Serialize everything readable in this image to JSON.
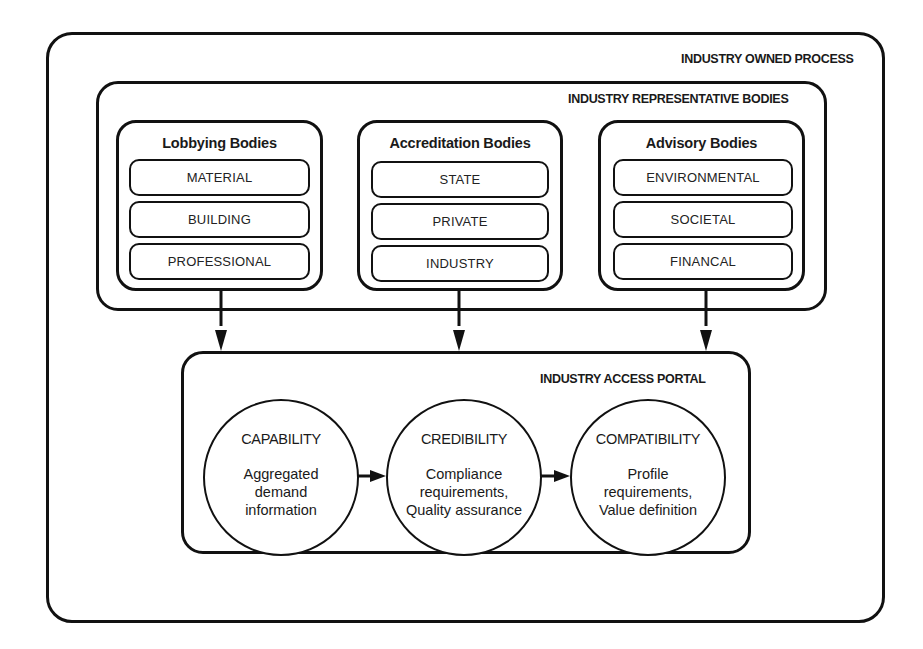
{
  "diagram": {
    "outer": {
      "label": "INDUSTRY OWNED PROCESS"
    },
    "representative": {
      "label": "INDUSTRY REPRESENTATIVE BODIES",
      "groups": [
        {
          "title": "Lobbying Bodies",
          "items": [
            "MATERIAL",
            "BUILDING",
            "PROFESSIONAL"
          ]
        },
        {
          "title": "Accreditation Bodies",
          "items": [
            "STATE",
            "PRIVATE",
            "INDUSTRY"
          ]
        },
        {
          "title": "Advisory Bodies",
          "items": [
            "ENVIRONMENTAL",
            "SOCIETAL",
            "FINANCAL"
          ]
        }
      ]
    },
    "portal": {
      "label": "INDUSTRY ACCESS PORTAL",
      "stages": [
        {
          "title": "CAPABILITY",
          "lines": [
            "Aggregated",
            "demand",
            "information"
          ]
        },
        {
          "title": "CREDIBILITY",
          "lines": [
            "Compliance",
            "requirements,",
            "Quality assurance"
          ]
        },
        {
          "title": "COMPATIBILITY",
          "lines": [
            "Profile",
            "requirements,",
            "Value definition"
          ]
        }
      ]
    },
    "connectors": [
      {
        "from": "Lobbying Bodies",
        "to": "INDUSTRY ACCESS PORTAL",
        "type": "arrow-down"
      },
      {
        "from": "Accreditation Bodies",
        "to": "INDUSTRY ACCESS PORTAL",
        "type": "arrow-down"
      },
      {
        "from": "Advisory Bodies",
        "to": "INDUSTRY ACCESS PORTAL",
        "type": "arrow-down"
      },
      {
        "from": "CAPABILITY",
        "to": "CREDIBILITY",
        "type": "arrow-right"
      },
      {
        "from": "CREDIBILITY",
        "to": "COMPATIBILITY",
        "type": "arrow-right"
      }
    ],
    "colors": {
      "stroke": "#111111",
      "text": "#1a1a1a",
      "background": "#ffffff"
    }
  }
}
